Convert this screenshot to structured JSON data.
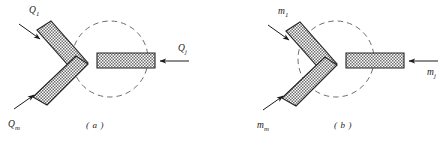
{
  "figure": {
    "background_color": "#ffffff",
    "ink_color": "#1a1a1a",
    "hatch_fill_color": "#8a8a8a",
    "panels": [
      {
        "id": "a",
        "caption": "( a )",
        "quantity_symbol": "Q",
        "labels": [
          {
            "name": "inlet-upper",
            "base": "Q",
            "sub": "1",
            "text": "Q1"
          },
          {
            "name": "inlet-lower",
            "base": "Q",
            "sub": "m",
            "text": "Qm"
          },
          {
            "name": "inlet-right",
            "base": "Q",
            "sub": "j",
            "text": "Qj"
          }
        ],
        "control_volume": {
          "shape": "dashed-circle",
          "cx": 110,
          "cy": 59,
          "r": 38
        },
        "members": [
          {
            "name": "upper-bar",
            "orientation": "diagonal-down-right",
            "hatched": true
          },
          {
            "name": "lower-bar",
            "orientation": "diagonal-up-right",
            "hatched": true
          },
          {
            "name": "horizontal-bar",
            "orientation": "horizontal",
            "hatched": true
          }
        ],
        "arrows": [
          {
            "name": "arrow-upper",
            "direction": "down-right"
          },
          {
            "name": "arrow-lower",
            "direction": "up-right"
          },
          {
            "name": "arrow-right",
            "direction": "left"
          }
        ]
      },
      {
        "id": "b",
        "caption": "( b )",
        "quantity_symbol": "m",
        "labels": [
          {
            "name": "inlet-upper",
            "base": "m",
            "sub": "1",
            "text": "m1"
          },
          {
            "name": "inlet-lower",
            "base": "m",
            "sub": "m",
            "text": "mm"
          },
          {
            "name": "inlet-right",
            "base": "m",
            "sub": "j",
            "text": "mj"
          }
        ],
        "control_volume": {
          "shape": "dashed-circle",
          "cx": 110,
          "cy": 59,
          "r": 38
        },
        "members": [
          {
            "name": "upper-bar",
            "orientation": "diagonal-down-right",
            "hatched": true
          },
          {
            "name": "lower-bar",
            "orientation": "diagonal-up-right",
            "hatched": true
          },
          {
            "name": "horizontal-bar",
            "orientation": "horizontal",
            "hatched": true
          }
        ],
        "arrows": [
          {
            "name": "arrow-upper",
            "direction": "down-right"
          },
          {
            "name": "arrow-lower",
            "direction": "up-right"
          },
          {
            "name": "arrow-right",
            "direction": "left"
          }
        ]
      }
    ]
  }
}
